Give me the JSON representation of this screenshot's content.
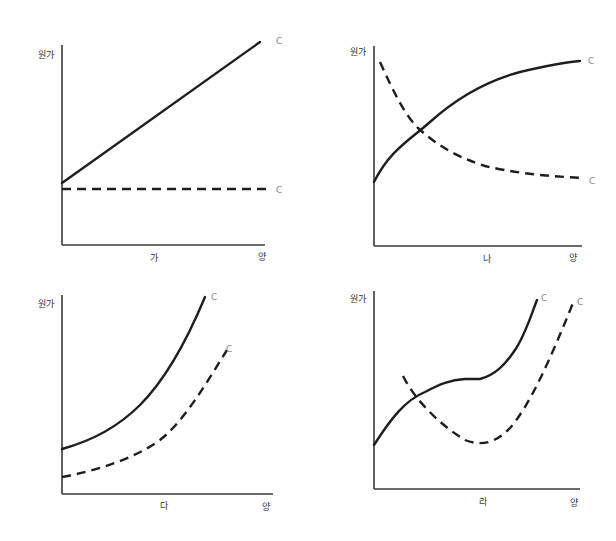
{
  "figure": {
    "title": "",
    "y_axis_label": "원가",
    "x_axis_label": "양",
    "colors": {
      "ink": "#1e1e1e",
      "axis": "#3a3a3a",
      "tag": "#8a8a8a",
      "background": "#ffffff"
    },
    "panels": [
      {
        "id": "ga",
        "label": "가",
        "y_label": "원가",
        "x_label": "양",
        "solid_tag": "C",
        "dashed_tag": "C",
        "description": "Solid line rises linearly; dashed line is constant (horizontal)"
      },
      {
        "id": "na",
        "label": "나",
        "y_label": "원가",
        "x_label": "양",
        "solid_tag": "C",
        "dashed_tag": "C",
        "description": "Solid curve rises at a decreasing rate (concave); dashed curve falls and levels off"
      },
      {
        "id": "da",
        "label": "다",
        "y_label": "원가",
        "x_label": "양",
        "solid_tag": "C",
        "dashed_tag": "C",
        "description": "Both curves rise at an increasing rate (convex); dashed lies below solid"
      },
      {
        "id": "ra",
        "label": "라",
        "y_label": "원가",
        "x_label": "양",
        "solid_tag": "C",
        "dashed_tag": "C",
        "description": "Solid curve is S-shaped (rises, flattens, rises steeply); dashed curve is U-shaped"
      }
    ]
  }
}
